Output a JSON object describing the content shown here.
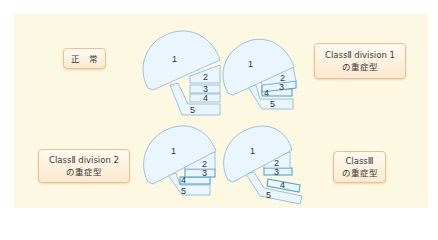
{
  "colors": {
    "panel_bg": "#fdf8e2",
    "label_border": "#e9c28f",
    "shape_fill": "#eaf5fd",
    "shape_stroke": "#7fb8e0"
  },
  "labels": {
    "normal": {
      "line1": "正　常"
    },
    "class2div1": {
      "line1": "ClassⅡ division 1",
      "line2": "の重症型"
    },
    "class2div2": {
      "line1": "ClassⅡ division 2",
      "line2": "の重症型"
    },
    "class3": {
      "line1": "ClassⅢ",
      "line2": "の重症型"
    }
  },
  "diagrams": [
    {
      "id": "normal",
      "parts": [
        "1",
        "2",
        "3",
        "4",
        "5"
      ]
    },
    {
      "id": "class2div1",
      "parts": [
        "1",
        "2",
        "3",
        "4",
        "5"
      ]
    },
    {
      "id": "class2div2",
      "parts": [
        "1",
        "2",
        "3",
        "4",
        "5"
      ]
    },
    {
      "id": "class3",
      "parts": [
        "1",
        "2",
        "3",
        "4",
        "5"
      ]
    }
  ]
}
